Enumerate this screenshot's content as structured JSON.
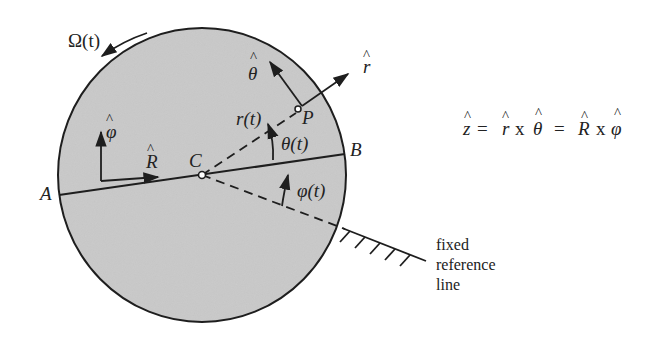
{
  "diagram": {
    "colors": {
      "disk_fill": "#c9c9c9",
      "stroke": "#1e1e1e",
      "background": "#ffffff"
    },
    "labels": {
      "omega": "Ω(t)",
      "theta_hat": "θ",
      "r_hat": "r",
      "phi_hat": "φ",
      "R_hat": "R",
      "point_C": "C",
      "point_P": "P",
      "point_A": "A",
      "point_B": "B",
      "r_t": "r(t)",
      "theta_t": "θ(t)",
      "phi_t": "φ(t)",
      "hat": "^"
    },
    "equation": {
      "z": "z",
      "eq1": "=",
      "r": "r",
      "x1": "x",
      "theta": "θ",
      "eq2": "=",
      "R": "R",
      "x2": "x",
      "phi": "φ"
    },
    "caption": {
      "line1": "fixed",
      "line2": "reference",
      "line3": "line"
    }
  }
}
